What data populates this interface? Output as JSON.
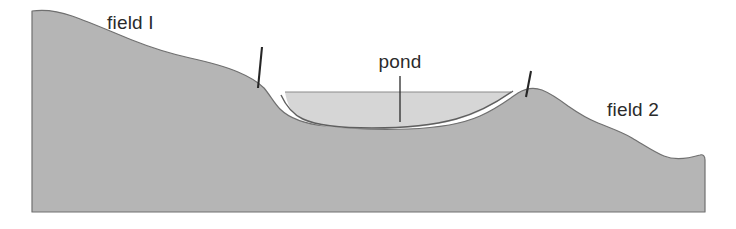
{
  "figure": {
    "background_color": "#ffffff",
    "width": 736,
    "height": 229
  },
  "colors": {
    "ground_fill": "#b5b5b5",
    "ground_outline": "#707070",
    "water_fill": "#d6d6d6",
    "water_surface_line": "#8a8a8a",
    "pond_floor_line": "#5f5f5f",
    "post_color": "#262626",
    "label_color": "#2b2b2b"
  },
  "labels": [
    {
      "id": "field-1",
      "text": "field I",
      "x": 107,
      "y": 29,
      "anchor": "start",
      "has_leader": false
    },
    {
      "id": "pond",
      "text": "pond",
      "x": 400,
      "y": 68,
      "anchor": "middle",
      "has_leader": true,
      "leader": {
        "x1": 400,
        "y1": 76,
        "x2": 400,
        "y2": 122
      }
    },
    {
      "id": "field-2",
      "text": "field 2",
      "x": 607,
      "y": 116,
      "anchor": "start",
      "has_leader": false
    }
  ],
  "posts": [
    {
      "id": "post-left",
      "x1": 262,
      "y1": 47,
      "x2": 258,
      "y2": 88
    },
    {
      "id": "post-right",
      "x1": 531,
      "y1": 71,
      "x2": 526,
      "y2": 97
    }
  ],
  "geometry": {
    "ground_path": "M 32 11 C 46 9 58 11 72 16 C 92 23 112 32 132 40 C 152 48 172 54 190 58 C 208 62 224 66 238 72 C 250 77 258 82 264 88 C 270 95 274 103 280 109 C 290 119 306 124 326 126 C 352 129 382 130 408 129 C 436 128 462 124 480 116 C 496 109 508 100 518 93 C 526 88 534 87 542 90 C 552 94 560 100 568 106 C 578 113 588 119 598 123 C 610 128 622 132 632 138 C 644 145 654 152 664 156 C 676 161 690 158 700 155 C 703 154 705 156 705 160 L 705 212 L 32 212 Z",
    "water_path": "M 285 92 L 510 92 C 496 104 478 114 456 120 C 430 127 400 129 372 129 C 344 129 318 127 302 120 C 292 115 287 104 285 92 Z",
    "water_surface_path": "M 285 92 L 511 92",
    "pond_floor_path": "M 281 95 C 286 106 292 114 303 119 C 318 126 344 128 372 128 C 400 128 430 126 456 119 C 478 113 496 103 513 91"
  }
}
